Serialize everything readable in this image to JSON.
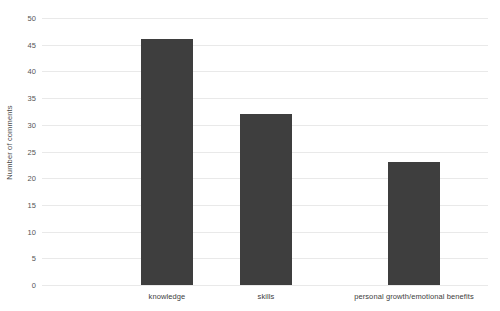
{
  "chart_data": {
    "type": "bar",
    "title": "",
    "subtitle": "",
    "xlabel": "",
    "ylabel": "Number of comments",
    "categories": [
      "knowledge",
      "skills",
      "personal growth/emotional benefits"
    ],
    "values": [
      46,
      32,
      23
    ],
    "ylim": [
      0,
      50
    ],
    "ytick_step": 5,
    "ytick_labels": [
      "0",
      "5",
      "10",
      "15",
      "20",
      "25",
      "30",
      "35",
      "40",
      "45",
      "50"
    ],
    "ytick_values": [
      0,
      5,
      10,
      15,
      20,
      25,
      30,
      35,
      40,
      45,
      50
    ],
    "grid": true,
    "grid_axis": "y",
    "legend": false,
    "legend_position": "none",
    "bar_color": "#3e3e3e",
    "grid_color": "#e9e9e9",
    "background_color": "#ffffff",
    "text_color": "#4a4a4a"
  }
}
